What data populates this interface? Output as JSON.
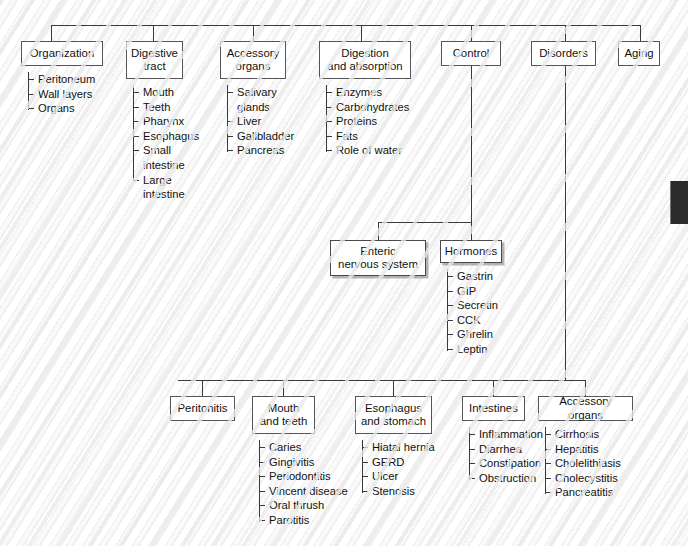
{
  "figure": {
    "name": "digestive-system-concept-map",
    "background_color": "#fdfdfd",
    "line_color": "#3a3a3a",
    "box_fill": "#ffffff",
    "box_border": "#555555"
  },
  "top_level": [
    {
      "id": "organization",
      "title": "Organization",
      "leaves": [
        "Peritoneum",
        "Wall layers",
        "Organs"
      ]
    },
    {
      "id": "digestive-tract",
      "title": "Digestive\ntract",
      "leaves": [
        "Mouth",
        "Teeth",
        "Pharynx",
        "Esophagus",
        "Small\n   intestine",
        "Large\n   intestine"
      ]
    },
    {
      "id": "accessory-organs",
      "title": "Accessory\norgans",
      "leaves": [
        "Salivary\n   glands",
        "Liver",
        "Gallbladder",
        "Pancreas"
      ]
    },
    {
      "id": "digestion-and-absorption",
      "title": "Digestion\nand absorption",
      "leaves": [
        "Enzymes",
        "Carbohydrates",
        "Proteins",
        "Fats",
        "Role of water"
      ]
    },
    {
      "id": "control",
      "title": "Control",
      "leaves": []
    },
    {
      "id": "disorders",
      "title": "Disorders",
      "leaves": []
    },
    {
      "id": "aging",
      "title": "Aging",
      "leaves": []
    }
  ],
  "control_children": [
    {
      "id": "enteric-nervous-system",
      "title": "Enteric\nnervous system",
      "leaves": []
    },
    {
      "id": "hormones",
      "title": "Hormones",
      "leaves": [
        "Gastrin",
        "GIP",
        "Secretin",
        "CCK",
        "Ghrelin",
        "Leptin"
      ]
    }
  ],
  "disorder_children": [
    {
      "id": "peritonitis",
      "title": "Peritonitis",
      "leaves": []
    },
    {
      "id": "mouth-and-teeth",
      "title": "Mouth\nand teeth",
      "leaves": [
        "Caries",
        "Gingivitis",
        "Periodontitis",
        "Vincent disease",
        "Oral thrush",
        "Parotitis"
      ]
    },
    {
      "id": "esophagus-and-stomach",
      "title": "Esophagus\nand stomach",
      "leaves": [
        "Hiatal hernia",
        "GERD",
        "Ulcer",
        "Stenosis"
      ]
    },
    {
      "id": "intestines",
      "title": "Intestines",
      "leaves": [
        "Inflammation",
        "Diarrhea",
        "Constipation",
        "Obstruction"
      ]
    },
    {
      "id": "disorders-accessory-organs",
      "title": "Accessory organs",
      "leaves": [
        "Cirrhosis",
        "Hepatitis",
        "Cholelithiasis",
        "Cholecystitis",
        "Pancreatitis"
      ]
    }
  ]
}
